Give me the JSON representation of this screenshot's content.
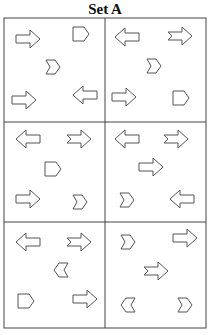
{
  "title": "Set A",
  "colors": {
    "stroke": "#555555",
    "grid": "#444444",
    "fill": "#ffffff"
  },
  "grid": {
    "x0": 4,
    "y0": 18,
    "x1": 206,
    "y1": 328,
    "col_split": 105,
    "row_splits": [
      122,
      222
    ]
  },
  "cells": [
    {
      "row": 0,
      "col": 0,
      "shapes": [
        {
          "type": "block-arrow",
          "dir": "right",
          "x": 16,
          "y": 30
        },
        {
          "type": "pentagon",
          "dir": "right",
          "x": 73,
          "y": 27
        },
        {
          "type": "chevron",
          "dir": "right",
          "x": 46,
          "y": 60
        },
        {
          "type": "block-arrow",
          "dir": "right",
          "x": 12,
          "y": 91
        },
        {
          "type": "block-arrow",
          "dir": "left",
          "x": 73,
          "y": 86
        }
      ]
    },
    {
      "row": 0,
      "col": 1,
      "shapes": [
        {
          "type": "block-arrow",
          "dir": "left",
          "x": 115,
          "y": 28
        },
        {
          "type": "notched-arrow",
          "dir": "right",
          "x": 168,
          "y": 27
        },
        {
          "type": "chevron",
          "dir": "right",
          "x": 147,
          "y": 59
        },
        {
          "type": "block-arrow",
          "dir": "right",
          "x": 112,
          "y": 88
        },
        {
          "type": "pentagon",
          "dir": "right",
          "x": 173,
          "y": 91
        }
      ]
    },
    {
      "row": 1,
      "col": 0,
      "shapes": [
        {
          "type": "block-arrow",
          "dir": "left",
          "x": 16,
          "y": 130
        },
        {
          "type": "notched-arrow",
          "dir": "right",
          "x": 67,
          "y": 130
        },
        {
          "type": "pentagon",
          "dir": "right",
          "x": 45,
          "y": 162
        },
        {
          "type": "block-arrow",
          "dir": "right",
          "x": 16,
          "y": 190
        },
        {
          "type": "chevron",
          "dir": "right",
          "x": 73,
          "y": 195
        }
      ]
    },
    {
      "row": 1,
      "col": 1,
      "shapes": [
        {
          "type": "block-arrow",
          "dir": "left",
          "x": 115,
          "y": 130
        },
        {
          "type": "notched-arrow",
          "dir": "right",
          "x": 164,
          "y": 130
        },
        {
          "type": "block-arrow",
          "dir": "right",
          "x": 139,
          "y": 158
        },
        {
          "type": "chevron",
          "dir": "right",
          "x": 120,
          "y": 193
        },
        {
          "type": "block-arrow",
          "dir": "left",
          "x": 170,
          "y": 190
        }
      ]
    },
    {
      "row": 2,
      "col": 0,
      "shapes": [
        {
          "type": "block-arrow",
          "dir": "left",
          "x": 16,
          "y": 233
        },
        {
          "type": "notched-arrow",
          "dir": "right",
          "x": 67,
          "y": 233
        },
        {
          "type": "chevron",
          "dir": "left",
          "x": 54,
          "y": 263
        },
        {
          "type": "pentagon",
          "dir": "right",
          "x": 18,
          "y": 294
        },
        {
          "type": "block-arrow",
          "dir": "right",
          "x": 73,
          "y": 290
        }
      ]
    },
    {
      "row": 2,
      "col": 1,
      "shapes": [
        {
          "type": "chevron",
          "dir": "right",
          "x": 121,
          "y": 235
        },
        {
          "type": "block-arrow",
          "dir": "right",
          "x": 173,
          "y": 229
        },
        {
          "type": "notched-arrow",
          "dir": "right",
          "x": 144,
          "y": 262
        },
        {
          "type": "chevron",
          "dir": "left",
          "x": 121,
          "y": 298
        },
        {
          "type": "chevron",
          "dir": "right",
          "x": 178,
          "y": 298
        }
      ]
    }
  ]
}
